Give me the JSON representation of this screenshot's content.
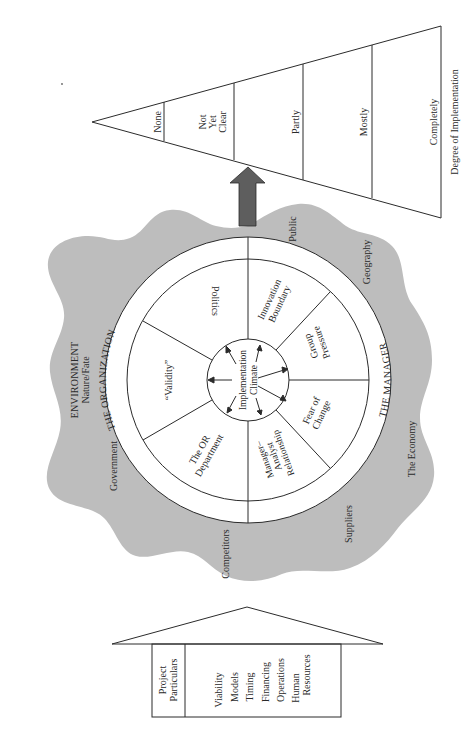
{
  "colors": {
    "environment_fill": "#bdbdbd",
    "arrow_fill": "#5e5e5e",
    "line": "#2b2b2b",
    "background": "#ffffff"
  },
  "environment": {
    "title": "ENVIRONMENT",
    "subtitle": "Nature/Fate",
    "factors": [
      "Government",
      "Competitors",
      "Suppliers",
      "The Economy",
      "Geography",
      "Public"
    ]
  },
  "wheel": {
    "ring_labels": {
      "organization": "THE ORGANIZATION",
      "manager": "THE MANAGER"
    },
    "hub": {
      "line1": "Implementation",
      "line2": "Climate"
    },
    "sectors": {
      "politics": [
        "Politics"
      ],
      "validity": [
        "“Validity”"
      ],
      "or_department": [
        "The OR",
        "Department"
      ],
      "manager_analyst": [
        "Manager–",
        "Analyst",
        "Relationship"
      ],
      "fear_of_change": [
        "Fear of",
        "Change"
      ],
      "group_pressure": [
        "Group",
        "Pressure"
      ],
      "innovation_boundary": [
        "Innovation",
        "Boundary"
      ]
    }
  },
  "implementation_scale": {
    "title": "Degree of Implementation",
    "levels": [
      "None",
      "Not",
      "Yet",
      "Clear",
      "Partly",
      "Mostly",
      "Completely"
    ]
  },
  "project_particulars": {
    "header_line1": "Project",
    "header_line2": "Particulars",
    "items": [
      "Viability",
      "Models",
      "Timing",
      "Financing",
      "Operations",
      "Human",
      "Resources"
    ]
  }
}
